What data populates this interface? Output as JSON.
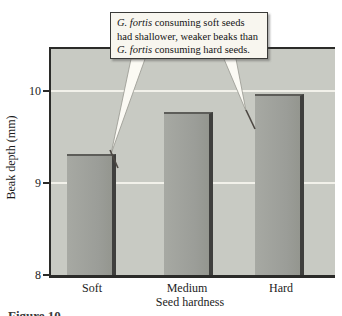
{
  "page": {
    "figure_caption": "Figure 10."
  },
  "callout": {
    "line1_italic": "G. fortis",
    "line1_rest": " consuming soft seeds",
    "line2": "had shallower, weaker beaks than",
    "line3_italic": "G. fortis",
    "line3_rest": " consuming hard seeds."
  },
  "chart_data": {
    "type": "bar",
    "categories": [
      "Soft",
      "Medium",
      "Hard"
    ],
    "values": [
      9.3,
      9.75,
      9.95
    ],
    "title": "",
    "xlabel": "Seed hardness",
    "ylabel": "Beak depth (mm)",
    "ylim": [
      8,
      10.5
    ],
    "ytick_labels": [
      "10",
      "9",
      "8"
    ],
    "yticks": [
      10,
      9,
      8
    ],
    "grid": "horizontal gridlines at 9 and 10, white, behind bars",
    "legend": "none",
    "annotation": "G. fortis consuming soft seeds had shallower, weaker beaks than G. fortis consuming hard seeds.",
    "annotation_targets": [
      "Soft bar",
      "Hard bar"
    ],
    "px_per_unit": 93,
    "colors": {
      "plot_background": "#c8cac3",
      "bar_fill": "#9b9d98",
      "bar_edge": "#3f3f3d",
      "gridline": "#f2f1ea",
      "axis": "#2b2b29",
      "callout_background": "#f8f6ef",
      "callout_border": "#3a3a38"
    }
  }
}
